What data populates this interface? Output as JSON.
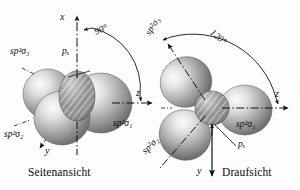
{
  "figure": {
    "background": "#fdfdfd",
    "ink": "#0d0d0d"
  },
  "panels": [
    {
      "id": "left",
      "caption": "Seitenansicht",
      "angle_label": "90°",
      "axes": [
        {
          "name": "x-axis",
          "label": "x",
          "direction": "up"
        },
        {
          "name": "z-axis",
          "label": "z",
          "direction": "right"
        },
        {
          "name": "y-axis",
          "label": "y",
          "direction": "down-left"
        }
      ],
      "orbitals": [
        {
          "name": "sp2sigma1",
          "label": "sp²σ₁"
        },
        {
          "name": "sp2sigma2",
          "label": "sp²σ₂"
        },
        {
          "name": "sp2sigma3",
          "label": "sp²σ₃"
        },
        {
          "name": "px",
          "label": "pₓ"
        }
      ]
    },
    {
      "id": "right",
      "caption": "Draufsicht",
      "angle_label": "120°",
      "axes": [
        {
          "name": "z-axis",
          "label": "z",
          "direction": "right"
        },
        {
          "name": "y-axis",
          "label": "y",
          "direction": "down"
        },
        {
          "name": "x-axis",
          "label": "x",
          "direction": "left"
        }
      ],
      "orbitals": [
        {
          "name": "sp2sigma1",
          "label": "sp²σ₁"
        },
        {
          "name": "sp2sigma2",
          "label": "sp²σ₂"
        },
        {
          "name": "sp2sigma3",
          "label": "sp²σ₃"
        },
        {
          "name": "px",
          "label": "pₓ"
        }
      ]
    }
  ],
  "glyphs": {
    "sp_prefix": "sp",
    "sp_exponent": "2",
    "sigma": "σ",
    "p_letter": "p",
    "x_subscript": "x",
    "one": "1",
    "two": "2",
    "three": "3"
  }
}
